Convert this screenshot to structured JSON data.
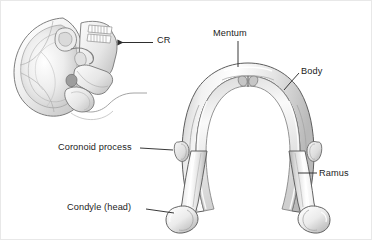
{
  "figure": {
    "background_color": "#ffffff",
    "border_color": "#e8e8e8",
    "line_color": "#3a3a3a",
    "label_color": "#1c1c1c",
    "bone_fill_light": "#fbfbfb",
    "bone_fill_mid": "#dcdcdc",
    "bone_fill_shadow": "#b4b4b4"
  },
  "panels": {
    "skull": {
      "name": "fetal-skull-lateral-view",
      "caption_abbreviation": "CR",
      "arrow_direction": "left"
    },
    "mandible": {
      "name": "mandible-superior-view"
    }
  },
  "labels": [
    {
      "id": "cr",
      "text": "CR",
      "leader": "arrow-left"
    },
    {
      "id": "mentum",
      "text": "Mentum",
      "leader": "vertical-down"
    },
    {
      "id": "body",
      "text": "Body",
      "leader": "diagonal-down-left"
    },
    {
      "id": "coronoid",
      "text": "Coronoid process",
      "leader": "horizontal-right"
    },
    {
      "id": "ramus",
      "text": "Ramus",
      "leader": "horizontal-left"
    },
    {
      "id": "condyle",
      "text": "Condyle (head)",
      "leader": "horizontal-right"
    }
  ]
}
